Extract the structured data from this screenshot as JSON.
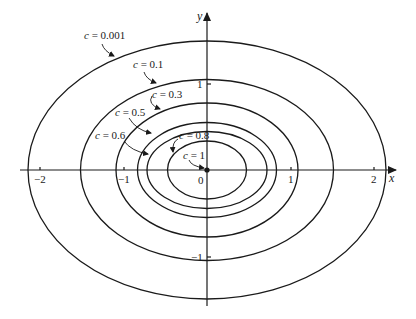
{
  "figure": {
    "stroke_color": "#1a1a1a",
    "background": "#ffffff"
  },
  "axes": {
    "x_label": "x",
    "y_label": "y",
    "x_ticks": [
      {
        "value": -2,
        "label": "−2"
      },
      {
        "value": -1,
        "label": "−1"
      },
      {
        "value": 0,
        "label": "0"
      },
      {
        "value": 1,
        "label": "1"
      },
      {
        "value": 2,
        "label": "2"
      }
    ],
    "y_ticks": [
      {
        "value": 1,
        "label": "1"
      },
      {
        "value": -1,
        "label": "−1"
      }
    ],
    "origin_label": "0"
  },
  "level_curves": [
    {
      "c": "0.001",
      "label_prefix": "c",
      "eq": " = ",
      "value": "0.001",
      "semi_x": 2.13,
      "semi_y": 1.5
    },
    {
      "c": "0.1",
      "label_prefix": "c",
      "eq": " = ",
      "value": "0.1",
      "semi_x": 1.51,
      "semi_y": 1.06
    },
    {
      "c": "0.3",
      "label_prefix": "c",
      "eq": " = ",
      "value": "0.3",
      "semi_x": 1.08,
      "semi_y": 0.78
    },
    {
      "c": "0.5",
      "label_prefix": "c",
      "eq": " = ",
      "value": "0.5",
      "semi_x": 0.83,
      "semi_y": 0.56
    },
    {
      "c": "0.6",
      "label_prefix": "c",
      "eq": " = ",
      "value": "0.6",
      "semi_x": 0.71,
      "semi_y": 0.45
    },
    {
      "c": "0.8",
      "label_prefix": "c",
      "eq": " = ",
      "value": "0.8",
      "semi_x": 0.47,
      "semi_y": 0.34
    },
    {
      "c": "1",
      "label_prefix": "c",
      "eq": " = ",
      "value": "1",
      "semi_x": 0.0,
      "semi_y": 0.0
    }
  ]
}
